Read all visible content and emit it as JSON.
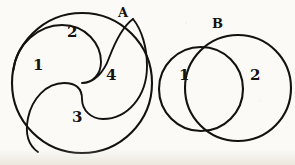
{
  "image": {
    "kind": "hand-drawn-geometry-diagram",
    "description": "Two figures: a circle subdivided by S-shaped curves into four regions, and two overlapping circles forming two regions.",
    "ink_color": "#141210",
    "paper_color": "#fbfaf7",
    "width": 295,
    "height": 165
  },
  "figures": [
    {
      "id": "figure-a",
      "label": "A",
      "label_pos": {
        "x": 122,
        "y": 8
      },
      "shape": "circle-with-two-s-curves",
      "outline": {
        "cx": 82,
        "cy": 83,
        "r": 70
      },
      "region_count": 4,
      "regions": [
        {
          "id": "a-region-1",
          "label": "1",
          "x": 39,
          "y": 65
        },
        {
          "id": "a-region-2",
          "label": "2",
          "x": 73,
          "y": 32
        },
        {
          "id": "a-region-3",
          "label": "3",
          "x": 78,
          "y": 117
        },
        {
          "id": "a-region-4",
          "label": "4",
          "x": 112,
          "y": 75
        }
      ]
    },
    {
      "id": "figure-b",
      "label": "B",
      "label_pos": {
        "x": 216,
        "y": 19
      },
      "shape": "two-overlapping-circles",
      "circles": [
        {
          "id": "b-circle-small",
          "cx": 201,
          "cy": 89,
          "r": 42
        },
        {
          "id": "b-circle-large",
          "cx": 238,
          "cy": 88,
          "r": 53
        }
      ],
      "region_count": 2,
      "regions": [
        {
          "id": "b-region-1",
          "label": "1",
          "x": 185,
          "y": 75
        },
        {
          "id": "b-region-2",
          "label": "2",
          "x": 256,
          "y": 75
        }
      ]
    }
  ]
}
